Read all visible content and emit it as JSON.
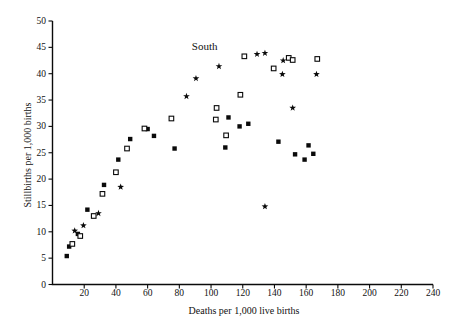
{
  "figure": {
    "annotation_label": "South",
    "x_axis_title": "Deaths per 1,000 live births",
    "y_axis_title": "Stillbirths per 1,000 births"
  },
  "chart_data": {
    "type": "scatter",
    "title": "South",
    "xlabel": "Deaths per 1,000 live births",
    "ylabel": "Stillbirths per 1,000 births",
    "xlim": [
      0,
      240
    ],
    "ylim": [
      0,
      50
    ],
    "xticks": [
      20,
      40,
      60,
      80,
      100,
      120,
      140,
      160,
      180,
      200,
      220,
      240
    ],
    "yticks": [
      0,
      5,
      10,
      15,
      20,
      25,
      30,
      35,
      40,
      45,
      50
    ],
    "grid": false,
    "legend": "none",
    "marker_color": "#0a0a0a",
    "annotation": {
      "text": "South",
      "x": 96,
      "y": 45
    },
    "series": [
      {
        "name": "filled-square",
        "marker": "filled-square",
        "points": [
          [
            9,
            5.4
          ],
          [
            10.5,
            7.2
          ],
          [
            16,
            9.6
          ],
          [
            22,
            14.2
          ],
          [
            32.5,
            18.9
          ],
          [
            41.5,
            23.7
          ],
          [
            49,
            27.6
          ],
          [
            60,
            29.5
          ],
          [
            64,
            28.2
          ],
          [
            77,
            25.8
          ],
          [
            109,
            26
          ],
          [
            111,
            31.7
          ],
          [
            118,
            30
          ],
          [
            123.5,
            30.5
          ],
          [
            142.5,
            27.1
          ],
          [
            153,
            24.7
          ],
          [
            159,
            23.7
          ],
          [
            161.5,
            26.4
          ],
          [
            164.5,
            24.8
          ]
        ]
      },
      {
        "name": "open-square",
        "marker": "open-square",
        "points": [
          [
            12.5,
            7.7
          ],
          [
            17.5,
            9.2
          ],
          [
            26,
            13
          ],
          [
            31.5,
            17.2
          ],
          [
            40,
            21.3
          ],
          [
            47,
            25.8
          ],
          [
            58,
            29.6
          ],
          [
            75,
            31.5
          ],
          [
            103,
            31.3
          ],
          [
            103.5,
            33.5
          ],
          [
            109.5,
            28.3
          ],
          [
            118.5,
            36
          ],
          [
            121,
            43.3
          ],
          [
            139.5,
            41
          ],
          [
            149,
            43
          ],
          [
            151.5,
            42.6
          ],
          [
            167,
            42.8
          ]
        ]
      },
      {
        "name": "star",
        "marker": "star",
        "points": [
          [
            14,
            10.2
          ],
          [
            19.5,
            11.2
          ],
          [
            29,
            13.5
          ],
          [
            43,
            18.5
          ],
          [
            84.5,
            35.7
          ],
          [
            90.5,
            39.1
          ],
          [
            105,
            41.4
          ],
          [
            129,
            43.7
          ],
          [
            134,
            43.9
          ],
          [
            145.5,
            42.5
          ],
          [
            145,
            39.9
          ],
          [
            151.5,
            33.5
          ],
          [
            166.5,
            39.9
          ],
          [
            134,
            14.8
          ]
        ]
      }
    ]
  }
}
